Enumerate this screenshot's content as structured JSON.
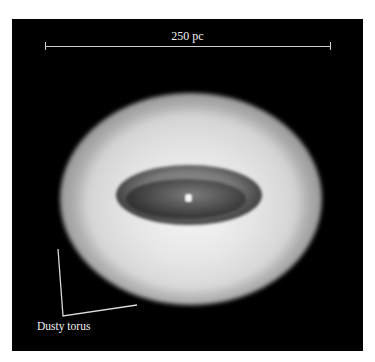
{
  "figure": {
    "scale_bar": {
      "label": "250 pc"
    },
    "annotations": [
      {
        "label": "Dusty torus"
      }
    ],
    "colors": {
      "background": "#000000",
      "page": "#ffffff",
      "annotation": "#f0f0f0"
    }
  }
}
